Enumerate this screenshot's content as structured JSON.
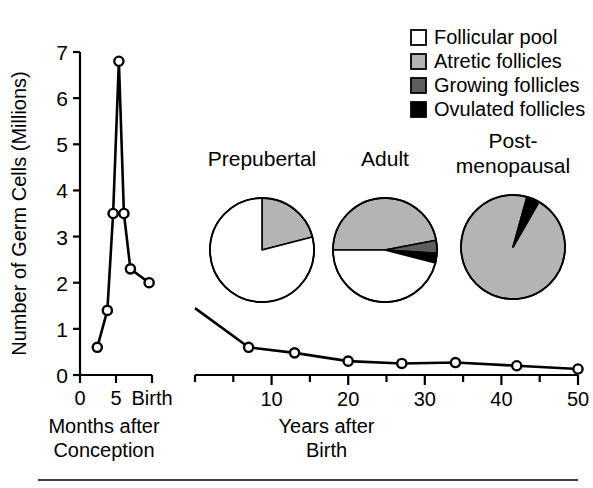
{
  "figure": {
    "name": "germ-cell-population-figure",
    "ylabel": "Number of Germ Cells (Millions)",
    "bottom_rule": true
  },
  "legend": {
    "position": "top-right",
    "items": [
      {
        "label": "Follicular pool",
        "swatch": "white-square-icon",
        "color": "#ffffff"
      },
      {
        "label": "Atretic follicles",
        "swatch": "light-gray-square-icon",
        "color": "#b4b4b4"
      },
      {
        "label": "Growing follicles",
        "swatch": "dark-gray-square-icon",
        "color": "#5e5e5e"
      },
      {
        "label": "Ovulated follicles",
        "swatch": "black-square-icon",
        "color": "#000000"
      }
    ]
  },
  "chart_data": [
    {
      "type": "line",
      "name": "prenatal-panel",
      "title": "",
      "xlabel": "Months after Conception",
      "ylabel": "Number of Germ Cells (Millions)",
      "xlim": [
        0,
        10
      ],
      "ylim": [
        0,
        7
      ],
      "xticks": [
        0,
        5,
        10
      ],
      "xticklabels": [
        "0",
        "5",
        "Birth"
      ],
      "yticks": [
        0,
        1,
        2,
        3,
        4,
        5,
        6,
        7
      ],
      "yticklabels": [
        "0",
        "1",
        "2",
        "3",
        "4",
        "5",
        "6",
        "7"
      ],
      "grid": false,
      "marker": "open-circle",
      "x": [
        2.4,
        3.8,
        4.6,
        5.4,
        6.1,
        7.0,
        9.6
      ],
      "values": [
        0.6,
        1.4,
        3.5,
        6.8,
        3.5,
        2.3,
        2.0
      ]
    },
    {
      "type": "line",
      "name": "postnatal-panel",
      "title": "",
      "xlabel": "Years after Birth",
      "ylabel": "",
      "xlim": [
        0,
        50
      ],
      "ylim": [
        0,
        7
      ],
      "xticks": [
        0,
        5,
        10,
        15,
        20,
        25,
        30,
        35,
        40,
        45,
        50
      ],
      "xticklabels": [
        "",
        "",
        "10",
        "",
        "20",
        "",
        "30",
        "",
        "40",
        "",
        "50"
      ],
      "grid": false,
      "marker": "open-circle",
      "x": [
        0,
        7,
        13,
        20,
        27,
        34,
        42,
        50
      ],
      "values": [
        1.45,
        0.6,
        0.48,
        0.3,
        0.25,
        0.27,
        0.2,
        0.13
      ]
    },
    {
      "type": "pie",
      "name": "prepubertal-pie",
      "title": "Prepubertal",
      "labels": [
        "Follicular pool",
        "Atretic follicles",
        "Growing follicles",
        "Ovulated follicles"
      ],
      "values": [
        79,
        21,
        0,
        0
      ],
      "colors": [
        "#ffffff",
        "#b4b4b4",
        "#5e5e5e",
        "#000000"
      ],
      "start_angle_deg": 0
    },
    {
      "type": "pie",
      "name": "adult-pie",
      "title": "Adult",
      "labels": [
        "Follicular pool",
        "Atretic follicles",
        "Growing follicles",
        "Ovulated follicles"
      ],
      "values": [
        46,
        47,
        4,
        3
      ],
      "colors": [
        "#ffffff",
        "#b4b4b4",
        "#5e5e5e",
        "#000000"
      ],
      "start_angle_deg": 0
    },
    {
      "type": "pie",
      "name": "postmenopausal-pie",
      "title": "Post-\nmenopausal",
      "title_lines": [
        "Post-",
        "menopausal"
      ],
      "labels": [
        "Follicular pool",
        "Atretic follicles",
        "Growing follicles",
        "Ovulated follicles"
      ],
      "values": [
        0,
        96,
        0,
        4
      ],
      "colors": [
        "#ffffff",
        "#b4b4b4",
        "#5e5e5e",
        "#000000"
      ],
      "start_angle_deg": 0
    }
  ]
}
